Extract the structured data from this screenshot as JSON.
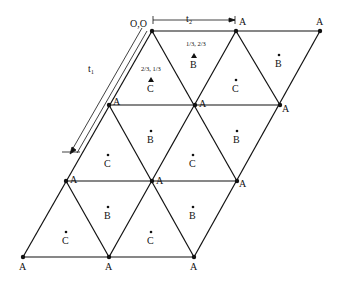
{
  "diagram": {
    "origin_label": "O,O",
    "vectors": [
      {
        "name": "t1",
        "label": "t₁"
      },
      {
        "name": "t2",
        "label": "t₂"
      }
    ],
    "site_labels": {
      "A": "A",
      "B": "B",
      "C": "C"
    },
    "fractional_coords": {
      "B": "1/3, 2/3",
      "C": "2/3, 1/3"
    },
    "lattice_rows": [
      {
        "row": 1,
        "a_sites": 3
      },
      {
        "row": 2,
        "a_sites": 3
      },
      {
        "row": 3,
        "a_sites": 3
      },
      {
        "row": 4,
        "a_sites": 3
      }
    ],
    "colors": {
      "line": "#111111",
      "background": "#ffffff"
    }
  }
}
